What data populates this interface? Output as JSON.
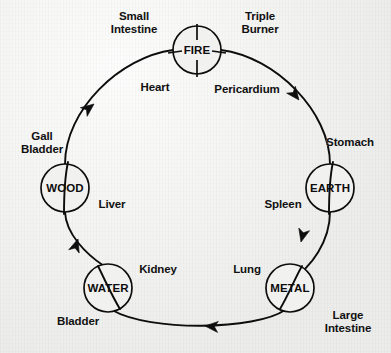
{
  "diagram": {
    "type": "cycle-diagram",
    "direction": "clockwise",
    "background_color": "#f1f1ef",
    "ink_color": "#0d0d0d",
    "elements": [
      {
        "id": "fire",
        "label": "FIRE",
        "cx": 197,
        "cy": 50,
        "r": 24
      },
      {
        "id": "earth",
        "label": "EARTH",
        "cx": 330,
        "cy": 188,
        "r": 24
      },
      {
        "id": "metal",
        "label": "METAL",
        "cx": 290,
        "cy": 288,
        "r": 24
      },
      {
        "id": "water",
        "label": "WATER",
        "cx": 108,
        "cy": 288,
        "r": 24
      },
      {
        "id": "wood",
        "label": "WOOD",
        "cx": 65,
        "cy": 188,
        "r": 24
      }
    ],
    "organs": [
      {
        "id": "small-intestine",
        "label": "Small\nIntestine",
        "x": 134,
        "y": 23,
        "element": "fire"
      },
      {
        "id": "triple-burner",
        "label": "Triple\nBurner",
        "x": 260,
        "y": 23,
        "element": "fire"
      },
      {
        "id": "heart",
        "label": "Heart",
        "x": 155,
        "y": 88,
        "element": "fire"
      },
      {
        "id": "pericardium",
        "label": "Pericardium",
        "x": 247,
        "y": 90,
        "element": "fire"
      },
      {
        "id": "stomach",
        "label": "Stomach",
        "x": 350,
        "y": 143,
        "element": "earth"
      },
      {
        "id": "spleen",
        "label": "Spleen",
        "x": 283,
        "y": 205,
        "element": "earth"
      },
      {
        "id": "lung",
        "label": "Lung",
        "x": 247,
        "y": 270,
        "element": "metal"
      },
      {
        "id": "large-intestine",
        "label": "Large\nIntestine",
        "x": 348,
        "y": 322,
        "element": "metal"
      },
      {
        "id": "bladder",
        "label": "Bladder",
        "x": 78,
        "y": 322,
        "element": "water"
      },
      {
        "id": "kidney",
        "label": "Kidney",
        "x": 158,
        "y": 270,
        "element": "water"
      },
      {
        "id": "liver",
        "label": "Liver",
        "x": 112,
        "y": 205,
        "element": "wood"
      },
      {
        "id": "gall-bladder",
        "label": "Gall\nBladder",
        "x": 42,
        "y": 143,
        "element": "wood"
      }
    ],
    "arcs": [
      {
        "id": "fire-to-earth",
        "from": "fire",
        "to": "earth",
        "arrow_at": {
          "x": 298,
          "y": 99
        },
        "arrow_angle": 52
      },
      {
        "id": "earth-to-metal",
        "from": "earth",
        "to": "metal",
        "arrow_at": {
          "x": 301,
          "y": 241
        },
        "arrow_angle": 104
      },
      {
        "id": "metal-to-water",
        "from": "metal",
        "to": "water",
        "arrow_at": {
          "x": 206,
          "y": 326
        },
        "arrow_angle": 184
      },
      {
        "id": "water-to-wood",
        "from": "water",
        "to": "wood",
        "arrow_at": {
          "x": 78,
          "y": 240
        },
        "arrow_angle": 285
      },
      {
        "id": "wood-to-fire",
        "from": "wood",
        "to": "fire",
        "arrow_at": {
          "x": 93,
          "y": 105
        },
        "arrow_angle": 322
      }
    ]
  }
}
